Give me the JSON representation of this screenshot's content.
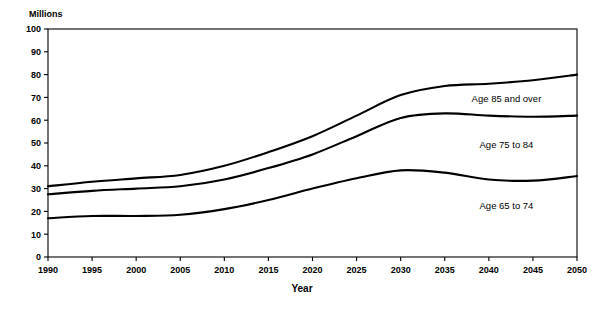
{
  "chart_data": {
    "type": "line",
    "title": "",
    "subtitle": "",
    "xlabel": "Year",
    "ylabel": "Millions",
    "ylabel_position": "top-left",
    "grid": false,
    "legend_position": "inline-right",
    "stacked_cumulative": true,
    "xlim": [
      1990,
      2050
    ],
    "ylim": [
      0,
      100
    ],
    "x": [
      1990,
      1995,
      2000,
      2005,
      2010,
      2015,
      2020,
      2025,
      2030,
      2035,
      2040,
      2045,
      2050
    ],
    "xticks": [
      "1990",
      "1995",
      "2000",
      "2005",
      "2010",
      "2015",
      "2020",
      "2025",
      "2030",
      "2035",
      "2040",
      "2045",
      "2050"
    ],
    "yticks": [
      "0",
      "10",
      "20",
      "30",
      "40",
      "50",
      "60",
      "70",
      "80",
      "90",
      "100"
    ],
    "ytick_values": [
      0,
      10,
      20,
      30,
      40,
      50,
      60,
      70,
      80,
      90,
      100
    ],
    "series": [
      {
        "name": "Age 65 to 74",
        "label": "Age 65 to 74",
        "label_x": 2042,
        "label_y": 21,
        "color": "#000000",
        "values": [
          17,
          18,
          18,
          18.5,
          21,
          25,
          30,
          34.5,
          38,
          37,
          34,
          33.5,
          35.5
        ]
      },
      {
        "name": "Age 75 to 84",
        "label": "Age 75 to 84",
        "label_x": 2042,
        "label_y": 48,
        "color": "#000000",
        "values": [
          27.5,
          29,
          30,
          31,
          34,
          39,
          45,
          53,
          61,
          63,
          62,
          61.5,
          62
        ]
      },
      {
        "name": "Age 85 and over",
        "label": "Age 85 and over",
        "label_x": 2042,
        "label_y": 68,
        "color": "#000000",
        "values": [
          31,
          33,
          34.5,
          36,
          40,
          46,
          53,
          62,
          71,
          75,
          76,
          77.5,
          80
        ]
      }
    ]
  },
  "axis": {
    "y_unit_label": "Millions",
    "x_title": "Year"
  },
  "colors": {
    "line": "#000000",
    "axis": "#000000",
    "background": "#ffffff"
  }
}
